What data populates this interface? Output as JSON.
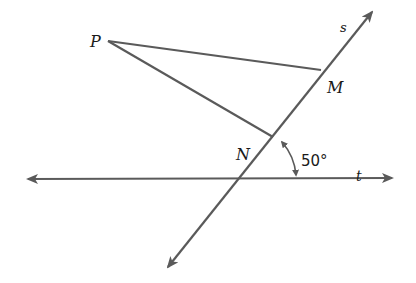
{
  "diagram": {
    "colors": {
      "line": "#5a5a5a",
      "text": "#1a1a1a",
      "background": "#ffffff"
    },
    "points": {
      "P": {
        "label": "P",
        "x": 108,
        "y": 41
      },
      "M": {
        "label": "M",
        "x": 321,
        "y": 70
      },
      "N": {
        "label": "N",
        "x": 273,
        "y": 137
      }
    },
    "lines": {
      "s": {
        "label": "s",
        "from": [
          168,
          267
        ],
        "to": [
          372,
          12
        ]
      },
      "t": {
        "label": "t",
        "from": [
          28,
          179
        ],
        "to": [
          392,
          178
        ]
      }
    },
    "segments": [
      {
        "name": "PM",
        "from": "P",
        "to": "M"
      },
      {
        "name": "PN",
        "from": "P",
        "to": "N"
      }
    ],
    "angle": {
      "label": "50°",
      "value": 50,
      "vertex": [
        238,
        178
      ]
    }
  }
}
